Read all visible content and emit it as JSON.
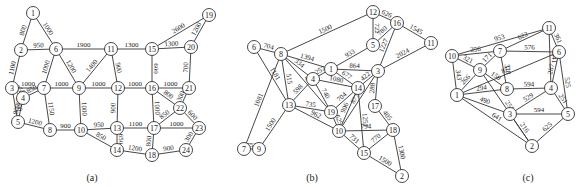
{
  "panels": [
    {
      "id": "a",
      "caption": "(a)",
      "nodes": [
        "1",
        "2",
        "3",
        "4",
        "5",
        "6",
        "7",
        "8",
        "9",
        "10",
        "11",
        "12",
        "13",
        "14",
        "15",
        "16",
        "17",
        "18",
        "19",
        "20",
        "21",
        "22",
        "23",
        "24"
      ],
      "edges": [
        {
          "from": "1",
          "to": "2",
          "weight": "800"
        },
        {
          "from": "1",
          "to": "6",
          "weight": "1000"
        },
        {
          "from": "2",
          "to": "6",
          "weight": "950"
        },
        {
          "from": "2",
          "to": "3",
          "weight": "1100"
        },
        {
          "from": "3",
          "to": "7",
          "weight": "1000"
        },
        {
          "from": "3",
          "to": "4",
          "weight": "250"
        },
        {
          "from": "3",
          "to": "5",
          "weight": "1000"
        },
        {
          "from": "4",
          "to": "7",
          "weight": "850"
        },
        {
          "from": "4",
          "to": "5",
          "weight": "800"
        },
        {
          "from": "5",
          "to": "8",
          "weight": "1200"
        },
        {
          "from": "6",
          "to": "7",
          "weight": "1000"
        },
        {
          "from": "6",
          "to": "9",
          "weight": "1200"
        },
        {
          "from": "6",
          "to": "11",
          "weight": "1900"
        },
        {
          "from": "7",
          "to": "9",
          "weight": "1000"
        },
        {
          "from": "7",
          "to": "8",
          "weight": "1150"
        },
        {
          "from": "8",
          "to": "10",
          "weight": "900"
        },
        {
          "from": "9",
          "to": "10",
          "weight": "1000"
        },
        {
          "from": "9",
          "to": "11",
          "weight": "1400"
        },
        {
          "from": "9",
          "to": "12",
          "weight": "1000"
        },
        {
          "from": "10",
          "to": "13",
          "weight": "950"
        },
        {
          "from": "10",
          "to": "14",
          "weight": "850"
        },
        {
          "from": "11",
          "to": "12",
          "weight": "900"
        },
        {
          "from": "11",
          "to": "15",
          "weight": "1300"
        },
        {
          "from": "12",
          "to": "13",
          "weight": "900"
        },
        {
          "from": "12",
          "to": "16",
          "weight": "1000"
        },
        {
          "from": "13",
          "to": "14",
          "weight": "650"
        },
        {
          "from": "13",
          "to": "17",
          "weight": "1100"
        },
        {
          "from": "14",
          "to": "18",
          "weight": "1200"
        },
        {
          "from": "15",
          "to": "16",
          "weight": "600"
        },
        {
          "from": "15",
          "to": "19",
          "weight": "2600"
        },
        {
          "from": "15",
          "to": "20",
          "weight": "1300"
        },
        {
          "from": "16",
          "to": "17",
          "weight": "1000"
        },
        {
          "from": "16",
          "to": "21",
          "weight": "1000"
        },
        {
          "from": "16",
          "to": "22",
          "weight": "800"
        },
        {
          "from": "17",
          "to": "18",
          "weight": "800"
        },
        {
          "from": "17",
          "to": "22",
          "weight": "850"
        },
        {
          "from": "17",
          "to": "23",
          "weight": "1000"
        },
        {
          "from": "18",
          "to": "24",
          "weight": "900"
        },
        {
          "from": "19",
          "to": "20",
          "weight": "1200"
        },
        {
          "from": "20",
          "to": "21",
          "weight": "700"
        },
        {
          "from": "21",
          "to": "22",
          "weight": "300"
        },
        {
          "from": "22",
          "to": "23",
          "weight": "600"
        },
        {
          "from": "23",
          "to": "24",
          "weight": "300"
        }
      ]
    },
    {
      "id": "b",
      "caption": "(b)",
      "nodes": [
        "1",
        "2",
        "3",
        "4",
        "5",
        "6",
        "7",
        "8",
        "9",
        "10",
        "11",
        "12",
        "13",
        "14",
        "15",
        "16",
        "17",
        "18",
        "19"
      ],
      "edges": [
        {
          "from": "6",
          "to": "8",
          "weight": "704"
        },
        {
          "from": "6",
          "to": "13",
          "weight": "1181"
        },
        {
          "from": "8",
          "to": "12",
          "weight": "1500"
        },
        {
          "from": "8",
          "to": "1",
          "weight": "1394"
        },
        {
          "from": "8",
          "to": "4",
          "weight": "334"
        },
        {
          "from": "8",
          "to": "19",
          "weight": "482"
        },
        {
          "from": "8",
          "to": "13",
          "weight": "515"
        },
        {
          "from": "8",
          "to": "7",
          "weight": "1081"
        },
        {
          "from": "7",
          "to": "9",
          "weight": "752"
        },
        {
          "from": "9",
          "to": "13",
          "weight": "1500"
        },
        {
          "from": "12",
          "to": "16",
          "weight": "626"
        },
        {
          "from": "12",
          "to": "5",
          "weight": "722"
        },
        {
          "from": "5",
          "to": "16",
          "weight": "780"
        },
        {
          "from": "5",
          "to": "1",
          "weight": "933"
        },
        {
          "from": "16",
          "to": "11",
          "weight": "1545"
        },
        {
          "from": "16",
          "to": "3",
          "weight": "1227"
        },
        {
          "from": "11",
          "to": "3",
          "weight": "2024"
        },
        {
          "from": "1",
          "to": "4",
          "weight": "257"
        },
        {
          "from": "1",
          "to": "3",
          "weight": "864"
        },
        {
          "from": "1",
          "to": "14",
          "weight": "677"
        },
        {
          "from": "4",
          "to": "14",
          "weight": "1080"
        },
        {
          "from": "4",
          "to": "13",
          "weight": "598"
        },
        {
          "from": "4",
          "to": "19",
          "weight": "740"
        },
        {
          "from": "3",
          "to": "14",
          "weight": "422"
        },
        {
          "from": "3",
          "to": "17",
          "weight": "288"
        },
        {
          "from": "3",
          "to": "10",
          "weight": "877"
        },
        {
          "from": "14",
          "to": "19",
          "weight": "704"
        },
        {
          "from": "14",
          "to": "10",
          "weight": "906"
        },
        {
          "from": "14",
          "to": "15",
          "weight": "1251"
        },
        {
          "from": "13",
          "to": "19",
          "weight": "735"
        },
        {
          "from": "13",
          "to": "10",
          "weight": "962"
        },
        {
          "from": "19",
          "to": "10",
          "weight": "625"
        },
        {
          "from": "17",
          "to": "18",
          "weight": "405"
        },
        {
          "from": "10",
          "to": "18",
          "weight": "794"
        },
        {
          "from": "10",
          "to": "15",
          "weight": "731"
        },
        {
          "from": "15",
          "to": "18",
          "weight": "770"
        },
        {
          "from": "15",
          "to": "2",
          "weight": "1500"
        },
        {
          "from": "18",
          "to": "2",
          "weight": "1300"
        }
      ]
    },
    {
      "id": "c",
      "caption": "(c)",
      "nodes": [
        "1",
        "2",
        "3",
        "4",
        "5",
        "6",
        "7",
        "8",
        "9",
        "10",
        "11"
      ],
      "edges": [
        {
          "from": "10",
          "to": "11",
          "weight": "953"
        },
        {
          "from": "10",
          "to": "7",
          "weight": "356"
        },
        {
          "from": "10",
          "to": "9",
          "weight": "321"
        },
        {
          "from": "10",
          "to": "1",
          "weight": "343"
        },
        {
          "from": "7",
          "to": "11",
          "weight": "622"
        },
        {
          "from": "7",
          "to": "6",
          "weight": "576"
        },
        {
          "from": "7",
          "to": "9",
          "weight": "171"
        },
        {
          "from": "7",
          "to": "8",
          "weight": "318"
        },
        {
          "from": "11",
          "to": "6",
          "weight": "361"
        },
        {
          "from": "11",
          "to": "4",
          "weight": "941"
        },
        {
          "from": "9",
          "to": "1",
          "weight": "266"
        },
        {
          "from": "9",
          "to": "8",
          "weight": "150"
        },
        {
          "from": "9",
          "to": "2",
          "weight": "251"
        },
        {
          "from": "1",
          "to": "6",
          "weight": "877"
        },
        {
          "from": "1",
          "to": "8",
          "weight": "294"
        },
        {
          "from": "1",
          "to": "3",
          "weight": "490"
        },
        {
          "from": "1",
          "to": "2",
          "weight": "641"
        },
        {
          "from": "6",
          "to": "4",
          "weight": "287"
        },
        {
          "from": "6",
          "to": "5",
          "weight": "525"
        },
        {
          "from": "8",
          "to": "4",
          "weight": "594"
        },
        {
          "from": "4",
          "to": "3",
          "weight": "529"
        },
        {
          "from": "4",
          "to": "5",
          "weight": "251"
        },
        {
          "from": "3",
          "to": "5",
          "weight": "594"
        },
        {
          "from": "3",
          "to": "2",
          "weight": "216"
        },
        {
          "from": "5",
          "to": "2",
          "weight": "625"
        }
      ]
    }
  ]
}
